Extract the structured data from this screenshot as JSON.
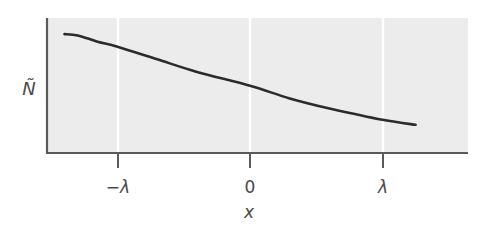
{
  "chart_data": {
    "type": "line",
    "title": "",
    "xlabel": "x",
    "ylabel": "Ñ",
    "x_ticks": [
      {
        "value": -1,
        "label": "−λ"
      },
      {
        "value": 0,
        "label": "0"
      },
      {
        "value": 1,
        "label": "λ"
      }
    ],
    "y_ticks": [],
    "grid": {
      "vertical": true,
      "horizontal": false,
      "color": "#ffffff"
    },
    "xlim": [
      -1.55,
      1.62
    ],
    "ylim": [
      0,
      1
    ],
    "legend": null,
    "series": [
      {
        "name": "Ñ(x)",
        "color": "#2b2b2b",
        "x": [
          -1.4,
          -1.3,
          -1.15,
          -1.0,
          -0.7,
          -0.4,
          0.0,
          0.3,
          0.6,
          1.0,
          1.25
        ],
        "y": [
          0.88,
          0.87,
          0.82,
          0.78,
          0.68,
          0.58,
          0.47,
          0.37,
          0.29,
          0.2,
          0.16
        ]
      }
    ],
    "colors": {
      "plot_background": "#ececec",
      "axis": "#5a5a5a",
      "text": "#4a4a4a"
    }
  }
}
